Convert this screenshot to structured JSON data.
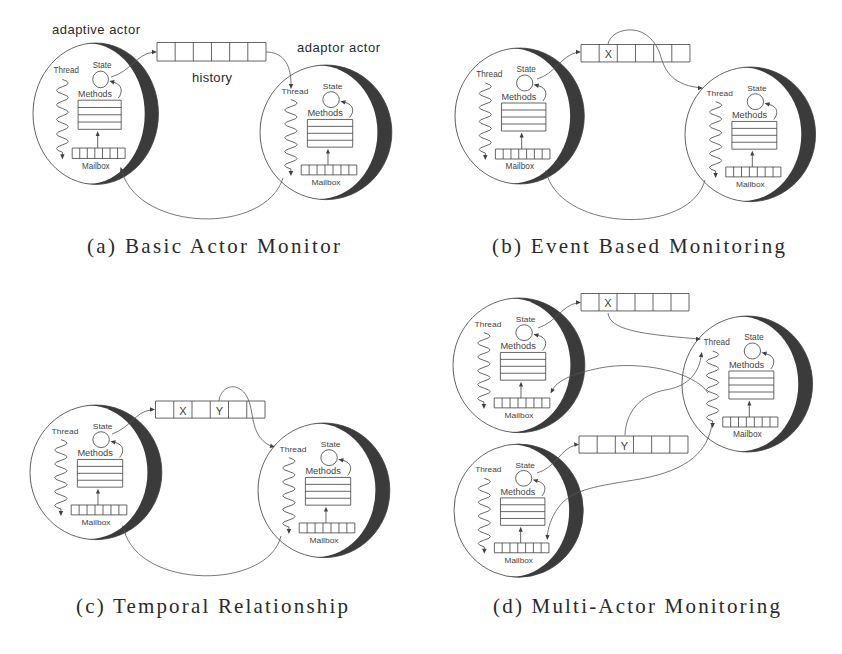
{
  "colors": {
    "background": "#ffffff",
    "ink": "#404040",
    "line": "#555555",
    "shadow": "#3b3b3b",
    "label": "#444444",
    "caption": "#2a2a2a"
  },
  "figure": {
    "panels": [
      {
        "caption": "(a) Basic Actor Monitor",
        "labels": {
          "left_actor": "adaptive actor",
          "right_actor": "adaptor actor",
          "history": "history"
        },
        "history_queues": [
          {
            "cells": [
              "",
              "",
              "",
              "",
              "",
              ""
            ]
          }
        ],
        "actors": [
          {
            "thread": "Thread",
            "state": "State",
            "methods": "Methods",
            "mailbox": "Mailbox"
          },
          {
            "thread": "Thread",
            "state": "State",
            "methods": "Methods",
            "mailbox": "Mailbox"
          }
        ]
      },
      {
        "caption": "(b) Event Based Monitoring",
        "history_queues": [
          {
            "cells": [
              "",
              "X",
              "",
              "",
              "",
              ""
            ]
          }
        ],
        "actors": [
          {
            "thread": "Thread",
            "state": "State",
            "methods": "Methods",
            "mailbox": "Mailbox"
          },
          {
            "thread": "Thread",
            "state": "State",
            "methods": "Methods",
            "mailbox": "Mailbox"
          }
        ]
      },
      {
        "caption": "(c) Temporal Relationship",
        "history_queues": [
          {
            "cells": [
              "",
              "X",
              "",
              "Y",
              "",
              ""
            ]
          }
        ],
        "actors": [
          {
            "thread": "Thread",
            "state": "State",
            "methods": "Methods",
            "mailbox": "Mailbox"
          },
          {
            "thread": "Thread",
            "state": "State",
            "methods": "Methods",
            "mailbox": "Mailbox"
          }
        ]
      },
      {
        "caption": "(d) Multi-Actor Monitoring",
        "history_queues": [
          {
            "cells": [
              "",
              "X",
              "",
              "",
              "",
              ""
            ]
          },
          {
            "cells": [
              "",
              "",
              "Y",
              "",
              "",
              ""
            ]
          }
        ],
        "actors": [
          {
            "thread": "Thread",
            "state": "State",
            "methods": "Methods",
            "mailbox": "Mailbox"
          },
          {
            "thread": "Thread",
            "state": "State",
            "methods": "Methods",
            "mailbox": "Mailbox"
          },
          {
            "thread": "Thread",
            "state": "State",
            "methods": "Methods",
            "mailbox": "Mailbox"
          }
        ]
      }
    ]
  }
}
